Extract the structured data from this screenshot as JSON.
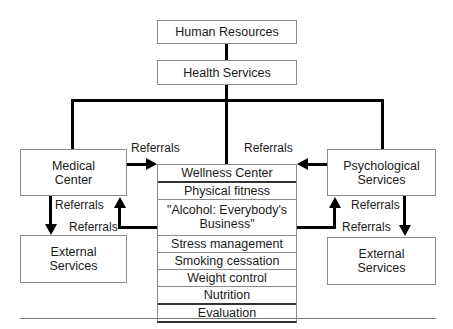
{
  "diagram": {
    "top_box": "Human Resources",
    "second_box": "Health Services",
    "left_box": [
      "Medical",
      "Center"
    ],
    "right_box": [
      "Psychological",
      "Services"
    ],
    "left_external": [
      "External",
      "Services"
    ],
    "right_external": [
      "External",
      "Services"
    ],
    "center_items": [
      "Wellness Center",
      "Physical fitness",
      "\"Alcohol: Everybody's",
      "Business\"",
      "Stress management",
      "Smoking cessation",
      "Weight control",
      "Nutrition",
      "Evaluation"
    ],
    "labels": {
      "medical_to_center": "Referrals",
      "psych_to_center": "Referrals",
      "medical_to_external": "Referrals",
      "center_to_medical": "Referrals",
      "psych_to_external": "Referrals",
      "center_to_psych": "Referrals"
    }
  }
}
